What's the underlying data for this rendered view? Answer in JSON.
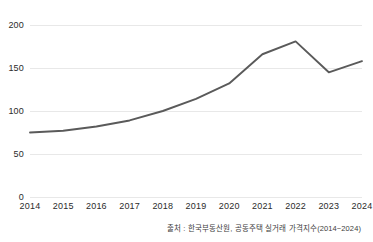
{
  "chart_data": {
    "type": "line",
    "title": "",
    "subtitle": "",
    "xlabel": "",
    "ylabel": "",
    "categories": [
      "2014",
      "2015",
      "2016",
      "2017",
      "2018",
      "2019",
      "2020",
      "2021",
      "2022",
      "2023",
      "2024"
    ],
    "x": [
      2014,
      2015,
      2016,
      2017,
      2018,
      2019,
      2020,
      2021,
      2022,
      2023,
      2024
    ],
    "values": [
      75,
      77,
      82,
      89,
      100,
      114,
      132,
      166,
      181,
      145,
      158
    ],
    "series": [
      {
        "name": "공동주택 실거래 가격지수",
        "values": [
          75,
          77,
          82,
          89,
          100,
          114,
          132,
          166,
          181,
          145,
          158
        ]
      }
    ],
    "ylim": [
      0,
      200
    ],
    "yticks": [
      0,
      50,
      100,
      150,
      200
    ],
    "ytick_labels": [
      "0",
      "50",
      "100",
      "150",
      "200"
    ],
    "xlim": [
      2014,
      2024
    ],
    "grid": "horizontal",
    "legend": "none",
    "line_color": "#5a5a5a",
    "grid_color": "#e8e8e8",
    "text_color": "#2b2b2b",
    "background_color": "#ffffff"
  },
  "source_note": {
    "text": "출처 : 한국부동산원, 공동주택 실거래 가격지수(2014~2024)"
  }
}
